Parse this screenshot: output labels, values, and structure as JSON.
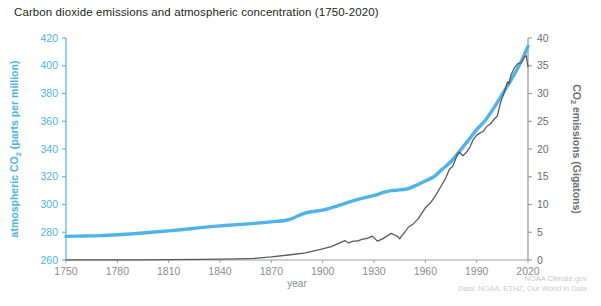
{
  "title": "Carbon dioxide emissions and atmospheric concentration (1750-2020)",
  "credits": {
    "line1": "NOAA Climate.gov",
    "line2": "Data: NOAA, ETHZ, Our World in Data"
  },
  "colors": {
    "co2_concentration": "#4eb3e8",
    "co2_emissions": "#58595b",
    "left_axis": "#4eb3e8",
    "right_axis": "#939598",
    "title": "#231f20",
    "xtick": "#8a8c8e",
    "credit": "#c9cbcd",
    "background": "#ffffff"
  },
  "chart_data": {
    "type": "line",
    "title": "Carbon dioxide emissions and atmospheric concentration (1750-2020)",
    "xlabel": "year",
    "xlim": [
      1750,
      2020
    ],
    "xticks": [
      1750,
      1780,
      1810,
      1840,
      1870,
      1900,
      1930,
      1960,
      1990,
      2020
    ],
    "grid": false,
    "legend": false,
    "axes": [
      {
        "id": "left",
        "label": "atmospheric CO2 (parts per million)",
        "label_prefix": "atmospheric CO",
        "label_sub": "2",
        "label_suffix": " (parts per million)",
        "ylim": [
          260,
          420
        ],
        "yticks": [
          260,
          280,
          300,
          320,
          340,
          360,
          380,
          400,
          420
        ],
        "color": "#4eb3e8"
      },
      {
        "id": "right",
        "label": "CO2 emissions (Gigatons)",
        "label_prefix": "CO",
        "label_sub": "2",
        "label_suffix": " emissions (Gigatons)",
        "ylim": [
          0,
          40
        ],
        "yticks": [
          0,
          5,
          10,
          15,
          20,
          25,
          30,
          35,
          40
        ],
        "color": "#939598"
      }
    ],
    "series": [
      {
        "name": "atmospheric CO2 concentration",
        "axis": "left",
        "unit": "parts per million",
        "color": "#4eb3e8",
        "linewidth": 3.4,
        "x": [
          1750,
          1760,
          1770,
          1780,
          1790,
          1800,
          1810,
          1820,
          1830,
          1840,
          1850,
          1860,
          1870,
          1880,
          1890,
          1900,
          1910,
          1920,
          1930,
          1935,
          1940,
          1945,
          1950,
          1955,
          1960,
          1965,
          1970,
          1975,
          1980,
          1985,
          1990,
          1995,
          2000,
          2005,
          2010,
          2015,
          2018,
          2020
        ],
        "y": [
          277,
          277.3,
          277.6,
          278.2,
          279.0,
          280.0,
          281.0,
          282.2,
          283.5,
          284.6,
          285.5,
          286.4,
          287.5,
          289.0,
          294.0,
          296.0,
          299.5,
          303.5,
          306.5,
          308.5,
          310.0,
          310.5,
          311.5,
          314.0,
          317.0,
          320.0,
          325.5,
          331.0,
          338.5,
          346.0,
          354.0,
          360.5,
          369.5,
          379.5,
          389.5,
          400.5,
          408.5,
          414.0
        ]
      },
      {
        "name": "CO2 emissions",
        "axis": "right",
        "unit": "Gigatons",
        "color": "#58595b",
        "linewidth": 1.3,
        "x": [
          1750,
          1770,
          1790,
          1810,
          1830,
          1850,
          1860,
          1870,
          1880,
          1890,
          1900,
          1905,
          1910,
          1913,
          1915,
          1918,
          1920,
          1923,
          1926,
          1929,
          1932,
          1935,
          1938,
          1940,
          1942,
          1944,
          1945,
          1946,
          1948,
          1950,
          1953,
          1956,
          1960,
          1963,
          1966,
          1969,
          1972,
          1974,
          1976,
          1979,
          1980,
          1982,
          1984,
          1986,
          1988,
          1990,
          1992,
          1994,
          1996,
          1998,
          2000,
          2002,
          2004,
          2006,
          2008,
          2009,
          2010,
          2012,
          2014,
          2016,
          2018,
          2019,
          2020
        ],
        "y": [
          0.01,
          0.02,
          0.03,
          0.05,
          0.1,
          0.2,
          0.3,
          0.55,
          0.9,
          1.3,
          2.0,
          2.4,
          3.1,
          3.5,
          3.1,
          3.4,
          3.4,
          3.7,
          3.9,
          4.3,
          3.4,
          3.8,
          4.4,
          4.8,
          4.5,
          4.2,
          3.8,
          4.3,
          5.0,
          5.9,
          6.5,
          7.5,
          9.4,
          10.3,
          11.6,
          13.2,
          14.8,
          16.3,
          16.9,
          19.2,
          19.4,
          18.8,
          19.4,
          20.3,
          21.7,
          22.5,
          22.9,
          23.2,
          24.1,
          24.5,
          25.3,
          25.9,
          28.4,
          30.1,
          32.1,
          31.8,
          33.3,
          34.6,
          35.4,
          35.5,
          36.6,
          36.8,
          34.8
        ]
      }
    ],
    "annotations": [
      "Emissions dip during the Great Depression (circa 1932)",
      "Emissions dip at the end of World War II (circa 1945)",
      "Emissions dip in 2020"
    ]
  }
}
